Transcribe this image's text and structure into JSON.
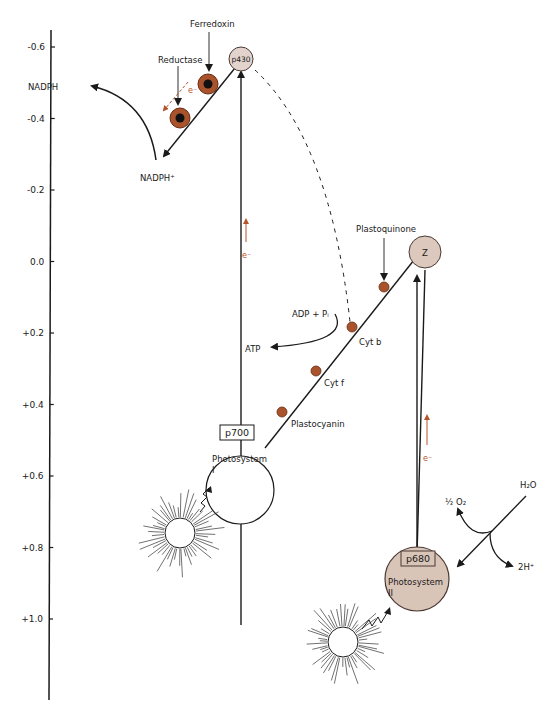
{
  "diagram": {
    "type": "Z-scheme of photosynthetic electron transport",
    "axis": {
      "ticks": [
        "-0.6",
        "-0.4",
        "-0.2",
        "0.0",
        "+0.2",
        "+0.4",
        "+0.6",
        "+0.8",
        "+1.0"
      ]
    },
    "carriers": {
      "p430": "p430",
      "ferredoxin": "Ferredoxin",
      "reductase": "Reductase",
      "z": "Z",
      "plastoquinone": "Plastoquinone",
      "cyt_b": "Cyt b",
      "cyt_f": "Cyt f",
      "plastocyanin": "Plastocyanin"
    },
    "photosystem_1": {
      "pigment": "p700",
      "line1": "Photosystem",
      "line2": "I"
    },
    "photosystem_2": {
      "pigment": "p680",
      "line1": "Photosystem",
      "line2": "II"
    },
    "products": {
      "nadph": "NADPH",
      "nadp": "NADPH⁺",
      "adp": "ADP + Pᵢ",
      "atp": "ATP",
      "h2o": "H₂O",
      "o2": "½ O₂",
      "h_plus": "2H⁺"
    },
    "electron_label": "e⁻",
    "colors": {
      "line": "#1a1a1a",
      "carrier_fill": "#a9532c",
      "carrier_dark": "#6b2a12",
      "core": "#111111",
      "photosystem2_fill": "#d9c4b8",
      "p430_fill": "#e2d4cc",
      "z_fill": "#dcc8bd",
      "electron_arrow": "#b5532b"
    }
  }
}
